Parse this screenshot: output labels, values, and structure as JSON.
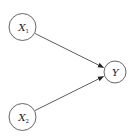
{
  "diagram": {
    "type": "directed-graph",
    "nodes": [
      {
        "id": "X1",
        "label": "X",
        "subscript": "1",
        "cx": 22.5,
        "cy": 27,
        "r": 13.5
      },
      {
        "id": "X2",
        "label": "X",
        "subscript": "2",
        "cx": 22.5,
        "cy": 117,
        "r": 13.5
      },
      {
        "id": "Y",
        "label": "Y",
        "subscript": "",
        "cx": 115,
        "cy": 72,
        "r": 11
      }
    ],
    "edges": [
      {
        "from": "X1",
        "to": "Y"
      },
      {
        "from": "X2",
        "to": "Y"
      }
    ],
    "colors": {
      "stroke": "#555555",
      "edge": "#333333",
      "text": "#222222",
      "background": "#ffffff"
    }
  }
}
